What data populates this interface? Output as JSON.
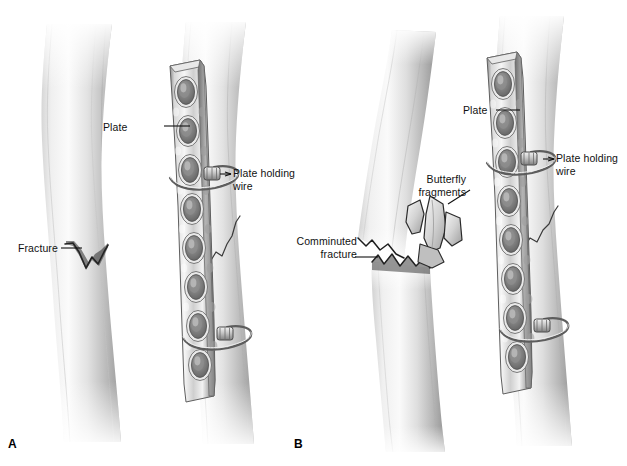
{
  "figure": {
    "kind": "medical-illustration",
    "width": 627,
    "height": 466,
    "background_color": "#ffffff",
    "ink_color": "#111111",
    "bone_light": "#f2f2f2",
    "bone_mid": "#c9c9c9",
    "bone_dark": "#8f8f8f",
    "plate_light": "#efefef",
    "plate_mid": "#bdbdbd",
    "plate_dark": "#6e6e6e",
    "hole_shadow": "#7d7d7d"
  },
  "panels": [
    {
      "id": "A",
      "letter": "A",
      "letter_x": 8,
      "letter_y": 438,
      "subject": "Simple transverse fracture fixed with plate"
    },
    {
      "id": "B",
      "letter": "B",
      "letter_x": 294,
      "letter_y": 438,
      "subject": "Comminuted fracture with butterfly fragments fixed with plate"
    }
  ],
  "annotations": [
    {
      "id": "plate-a",
      "panel": "A",
      "text": "Plate",
      "x": 130,
      "y": 120,
      "align": "left",
      "leader": {
        "x1": 164,
        "y1": 126,
        "x2": 190,
        "y2": 126
      }
    },
    {
      "id": "plate-holding-wire-a",
      "panel": "A",
      "text": "Plate holding\nwire",
      "x": 233,
      "y": 167,
      "align": "left",
      "leader": {
        "x1": 220,
        "y1": 174,
        "x2": 231,
        "y2": 174
      }
    },
    {
      "id": "fracture-a",
      "panel": "A",
      "text": "Fracture",
      "x": 18,
      "y": 242,
      "align": "left",
      "leader": {
        "x1": 61,
        "y1": 248,
        "x2": 82,
        "y2": 248
      }
    },
    {
      "id": "plate-b",
      "panel": "B",
      "text": "Plate",
      "x": 462,
      "y": 104,
      "align": "left",
      "leader": {
        "x1": 496,
        "y1": 110,
        "x2": 520,
        "y2": 110
      }
    },
    {
      "id": "plate-holding-wire-b",
      "panel": "B",
      "text": "Plate holding\nwire",
      "x": 556,
      "y": 152,
      "align": "left",
      "leader": {
        "x1": 543,
        "y1": 159,
        "x2": 554,
        "y2": 159
      }
    },
    {
      "id": "butterfly-fragments-b",
      "panel": "B",
      "text": "Butterfly\nfragments",
      "x": 418,
      "y": 174,
      "align": "left",
      "leader": {
        "x1": 448,
        "y1": 204,
        "x2": 470,
        "y2": 190
      }
    },
    {
      "id": "comminuted-fracture-b",
      "panel": "B",
      "text": "Comminuted\nfracture",
      "x": 297,
      "y": 235,
      "align": "left",
      "leader": {
        "x1": 355,
        "y1": 257,
        "x2": 378,
        "y2": 257
      }
    }
  ],
  "bones": [
    {
      "id": "bone-a-left",
      "panel": "A",
      "label": "fractured-bone-unfixed",
      "has_fracture": true,
      "fracture_type": "transverse-jagged"
    },
    {
      "id": "bone-a-right",
      "panel": "A",
      "label": "fractured-bone-plated",
      "has_fracture": true,
      "has_plate": true,
      "wire_count": 2
    },
    {
      "id": "bone-b-left",
      "panel": "B",
      "label": "comminuted-bone-unfixed",
      "has_fracture": true,
      "fracture_type": "comminuted",
      "fragment_count": 3
    },
    {
      "id": "bone-b-right",
      "panel": "B",
      "label": "comminuted-bone-plated",
      "has_fracture": true,
      "has_plate": true,
      "wire_count": 2
    }
  ],
  "plates": [
    {
      "id": "plate-a",
      "panel": "A",
      "hole_count": 8,
      "orientation": "vertical"
    },
    {
      "id": "plate-b",
      "panel": "B",
      "hole_count": 8,
      "orientation": "vertical"
    }
  ]
}
